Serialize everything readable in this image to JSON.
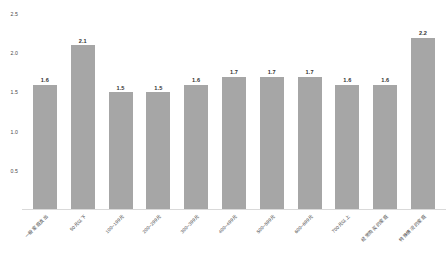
{
  "chart_data": {
    "type": "bar",
    "title": "",
    "subtitle": "",
    "xlabel": "",
    "ylabel": "",
    "ylim": [
      0,
      2.5
    ],
    "grid": false,
    "legend": false,
    "bar_color": "#a6a6a6",
    "categories": [
      "一般家庭支出",
      "50元以下",
      "100~199元",
      "200~299元",
      "300~399元",
      "400~499元",
      "500~599元",
      "600~699元",
      "700元以上",
      "经常购买的家庭",
      "特殊情况的家庭"
    ],
    "values": [
      1.6,
      2.1,
      1.5,
      1.5,
      1.6,
      1.7,
      1.7,
      1.7,
      1.6,
      1.6,
      2.2
    ],
    "value_labels": [
      "1.6",
      "2.1",
      "1.5",
      "1.5",
      "1.6",
      "1.7",
      "1.7",
      "1.7",
      "1.6",
      "1.6",
      "2.2"
    ],
    "yticks": [
      0.5,
      1.0,
      1.5,
      2.0,
      2.5
    ],
    "ytick_labels": [
      "0.5",
      "1.0",
      "1.5",
      "2.0",
      "2.5"
    ]
  }
}
